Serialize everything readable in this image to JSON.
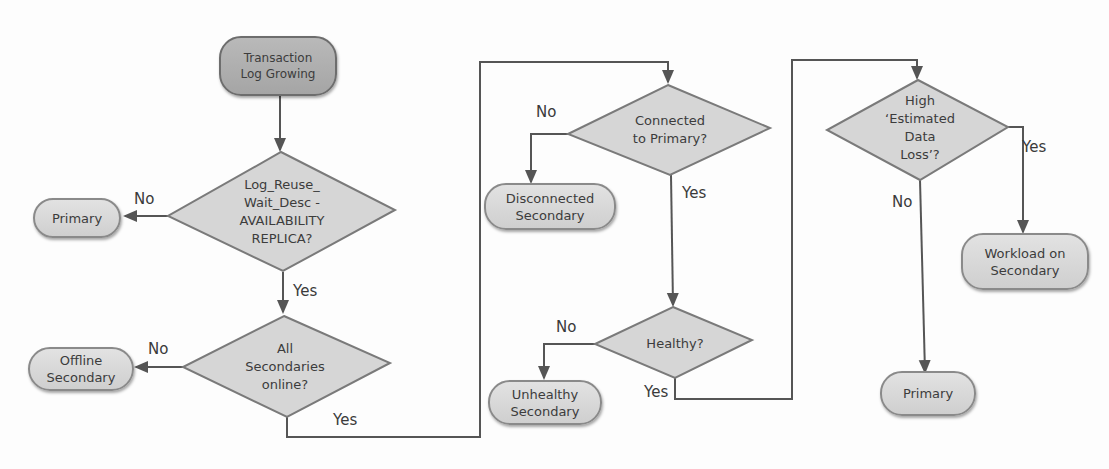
{
  "diagram": {
    "type": "flowchart",
    "colors": {
      "line": "#555555",
      "node_fill": "#d8d8d8",
      "start_fill": "#afafaf",
      "diamond_fill": "#d6d6d6"
    },
    "nodes": {
      "start": "Transaction Log Growing",
      "d1": "Log_Reuse_ Wait_Desc - AVAILABILITY REPLICA?",
      "d1_line1": "Log_Reuse_",
      "d1_line2": "Wait_Desc -",
      "d1_line3": "AVAILABILITY",
      "d1_line4": "REPLICA?",
      "primary1": "Primary",
      "d2_line1": "All",
      "d2_line2": "Secondaries",
      "d2_line3": "online?",
      "offline": "Offline Secondary",
      "offline_line1": "Offline",
      "offline_line2": "Secondary",
      "d3_line1": "Connected",
      "d3_line2": "to Primary?",
      "disconnected_line1": "Disconnected",
      "disconnected_line2": "Secondary",
      "d4": "Healthy?",
      "unhealthy_line1": "Unhealthy",
      "unhealthy_line2": "Secondary",
      "d5_line1": "High",
      "d5_line2": "‘Estimated",
      "d5_line3": "Data",
      "d5_line4": "Loss’?",
      "workload_line1": "Workload on",
      "workload_line2": "Secondary",
      "primary2": "Primary",
      "start_line1": "Transaction",
      "start_line2": "Log Growing"
    },
    "edges": {
      "d1_no": "No",
      "d1_yes": "Yes",
      "d2_no": "No",
      "d2_yes": "Yes",
      "d3_no": "No",
      "d3_yes": "Yes",
      "d4_no": "No",
      "d4_yes": "Yes",
      "d5_no": "No",
      "d5_yes": "Yes"
    }
  }
}
